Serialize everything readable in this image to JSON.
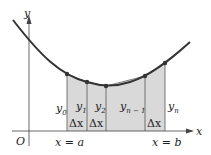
{
  "diagram": {
    "axes": {
      "x_label": "x",
      "y_label": "y",
      "origin_label": "O"
    },
    "bounds": {
      "left_label": "x = a",
      "right_label": "x = b"
    },
    "ordinates": [
      {
        "base": "y",
        "sub": "0"
      },
      {
        "base": "y",
        "sub": "1"
      },
      {
        "base": "y",
        "sub": "2"
      },
      {
        "base": "y",
        "sub": "n − 1"
      },
      {
        "base": "y",
        "sub": "n"
      }
    ],
    "delta_label": "Δx",
    "colors": {
      "fill": "#d9d9d9",
      "curve": "#333333",
      "axis": "#555555"
    }
  }
}
